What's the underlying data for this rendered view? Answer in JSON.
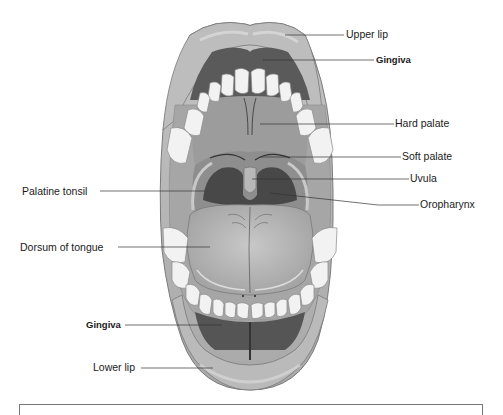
{
  "diagram": {
    "colors": {
      "lip": "#b4b4b4",
      "lip_highlight": "#d6d6d6",
      "lip_outline": "#7a7a7a",
      "gingiva": "#5a5a5a",
      "palate": "#9c9c9c",
      "teeth": "#f2f2f2",
      "tongue": "#b8b8b8",
      "pharynx": "#4a4a4a",
      "leader_line": "#333333",
      "text": "#1a1a1a"
    },
    "labels": {
      "upper_lip": "Upper lip",
      "gingiva_upper": "Gingiva",
      "hard_palate": "Hard palate",
      "soft_palate": "Soft palate",
      "uvula": "Uvula",
      "oropharynx": "Oropharynx",
      "palatine_tonsil": "Palatine tonsil",
      "dorsum_of_tongue": "Dorsum of tongue",
      "gingiva_lower": "Gingiva",
      "lower_lip": "Lower lip"
    }
  }
}
